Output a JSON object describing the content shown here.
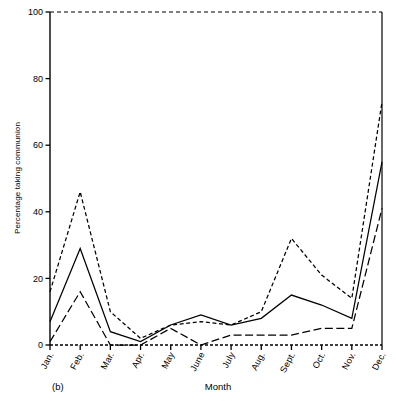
{
  "figure": {
    "panel_label": "(b)",
    "xlabel": "Month",
    "ylabel": "Percentage taking communion"
  },
  "axes": {
    "y_ticks": [
      "0",
      "20",
      "40",
      "60",
      "80",
      "100"
    ],
    "x_ticks": [
      "Jan.",
      "Feb.",
      "Mar.",
      "Apr.",
      "May",
      "June",
      "July",
      "Aug.",
      "Sept.",
      "Oct.",
      "Nov.",
      "Dec."
    ]
  },
  "chart_data": {
    "type": "line",
    "title": "",
    "subtitle": "",
    "panel": "(b)",
    "xlabel": "Month",
    "ylabel": "Percentage taking communion",
    "categories": [
      "Jan.",
      "Feb.",
      "Mar.",
      "Apr.",
      "May",
      "June",
      "July",
      "Aug.",
      "Sept.",
      "Oct.",
      "Nov.",
      "Dec."
    ],
    "ylim": [
      0,
      100
    ],
    "xlim": [
      0,
      11
    ],
    "yticks": [
      0,
      20,
      40,
      60,
      80,
      100
    ],
    "grid": false,
    "legend": "none",
    "series": [
      {
        "name": "upper",
        "style": "dashed",
        "color": "#000000",
        "values": [
          16,
          46,
          10,
          2,
          6,
          7,
          6,
          10,
          32,
          21,
          14,
          73
        ]
      },
      {
        "name": "middle",
        "style": "solid",
        "color": "#000000",
        "values": [
          7,
          29,
          4,
          1,
          6,
          9,
          6,
          8,
          15,
          12,
          8,
          55
        ]
      },
      {
        "name": "lower",
        "style": "long-dashed",
        "color": "#000000",
        "values": [
          1,
          16,
          0,
          0,
          5,
          0,
          3,
          3,
          3,
          5,
          5,
          41
        ]
      }
    ]
  }
}
